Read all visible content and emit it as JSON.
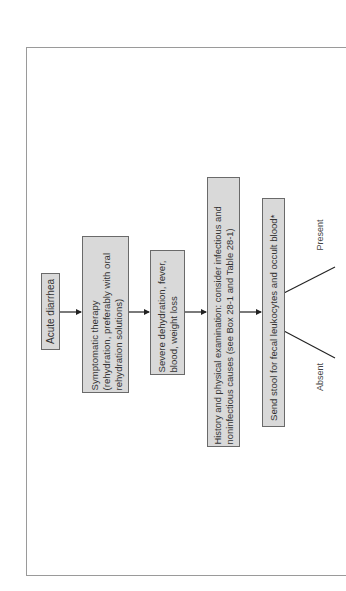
{
  "diagram": {
    "orientation": "rotated 90° counter-clockwise (reads bottom-to-top)",
    "nodes": [
      {
        "id": "acute-diarrhea",
        "text": "Acute diarrhea"
      },
      {
        "id": "symptomatic-therapy",
        "text": "Symptomatic therapy\n(rehydration, preferably with oral\nrehydration solutions)"
      },
      {
        "id": "severe-signs",
        "text": "Severe dehydration, fever,\nblood, weight loss"
      },
      {
        "id": "history-exam",
        "text": "History and physical examination: consider infectious and\nnoninfectious causes (see Box 28-1 and Table 28-1)"
      },
      {
        "id": "send-stool",
        "text": "Send stool for fecal leukocytes and occult blood*"
      }
    ],
    "edges": [
      {
        "from": "acute-diarrhea",
        "to": "symptomatic-therapy"
      },
      {
        "from": "symptomatic-therapy",
        "to": "severe-signs"
      },
      {
        "from": "severe-signs",
        "to": "history-exam"
      },
      {
        "from": "history-exam",
        "to": "send-stool"
      }
    ],
    "branches": [
      {
        "from": "send-stool",
        "label": "Present"
      },
      {
        "from": "send-stool",
        "label": "Absent"
      }
    ],
    "colors": {
      "box_fill": "#d9d9d9",
      "box_border": "#6a6a6a",
      "line": "#222222",
      "frame": "#9a9a9a"
    }
  }
}
